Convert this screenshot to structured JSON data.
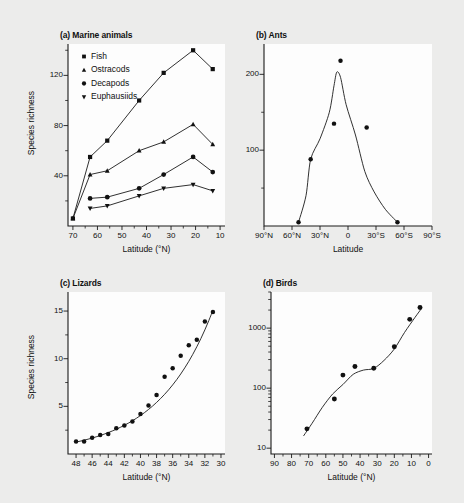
{
  "figure": {
    "background_color": "#ececeb",
    "plot_background_color": "#fdfdfd",
    "ink_color": "#1a1a1a"
  },
  "panels": {
    "a": {
      "title": "(a) Marine animals",
      "xlabel": "Latitude (°N)",
      "ylabel": "Species richness",
      "legend": [
        {
          "label": "Fish",
          "marker": "square"
        },
        {
          "label": "Ostracods",
          "marker": "triangle-up"
        },
        {
          "label": "Decapods",
          "marker": "circle"
        },
        {
          "label": "Euphausiids",
          "marker": "triangle-down"
        }
      ],
      "xticks": [
        "70",
        "60",
        "50",
        "40",
        "30",
        "20",
        "10"
      ],
      "yticks": [
        "40",
        "80",
        "120"
      ]
    },
    "b": {
      "title": "(b) Ants",
      "xlabel": "Latitude",
      "xticks": [
        "90°N",
        "60°N",
        "30°N",
        "0",
        "30°S",
        "60°S",
        "90°S"
      ],
      "yticks": [
        "100",
        "200"
      ]
    },
    "c": {
      "title": "(c) Lizards",
      "xlabel": "Latitude (°N)",
      "ylabel": "Species richness",
      "xticks": [
        "48",
        "46",
        "44",
        "42",
        "40",
        "38",
        "36",
        "34",
        "32",
        "30"
      ],
      "yticks": [
        "5",
        "10",
        "15"
      ]
    },
    "d": {
      "title": "(d) Birds",
      "xlabel": "Latitude (°N)",
      "xticks": [
        "90",
        "80",
        "70",
        "60",
        "50",
        "40",
        "30",
        "20",
        "10",
        "0"
      ],
      "yticks": [
        "10",
        "100",
        "1000"
      ]
    }
  },
  "chart_data": [
    {
      "panel": "a",
      "type": "line",
      "title": "(a) Marine animals",
      "xlabel": "Latitude (°N)",
      "ylabel": "Species richness",
      "xlim": [
        72,
        8
      ],
      "ylim": [
        0,
        145
      ],
      "x_reversed": true,
      "grid": false,
      "legend_position": "upper-left",
      "x": [
        70,
        63,
        56,
        43,
        33,
        21,
        13
      ],
      "series": [
        {
          "name": "Fish",
          "marker": "square",
          "values": [
            6,
            55,
            68,
            100,
            122,
            140,
            125
          ]
        },
        {
          "name": "Ostracods",
          "marker": "triangle-up",
          "values": [
            6,
            41,
            44,
            60,
            67,
            81,
            65
          ]
        },
        {
          "name": "Decapods",
          "marker": "circle",
          "values": [
            null,
            22,
            23,
            30,
            41,
            55,
            43
          ]
        },
        {
          "name": "Euphausiids",
          "marker": "triangle-down",
          "values": [
            null,
            14,
            16,
            24,
            30,
            33,
            28
          ]
        }
      ]
    },
    {
      "panel": "b",
      "type": "scatter",
      "title": "(b) Ants",
      "xlabel": "Latitude",
      "ylabel": "",
      "xlim": [
        90,
        -90
      ],
      "ylim": [
        0,
        240
      ],
      "grid": false,
      "fit_curve": true,
      "points": [
        {
          "x": 53,
          "y": 5
        },
        {
          "x": 40,
          "y": 88
        },
        {
          "x": 15,
          "y": 135
        },
        {
          "x": 8,
          "y": 218
        },
        {
          "x": -20,
          "y": 130
        },
        {
          "x": -53,
          "y": 5
        }
      ]
    },
    {
      "panel": "c",
      "type": "scatter",
      "title": "(c) Lizards",
      "xlabel": "Latitude (°N)",
      "ylabel": "Species richness",
      "xlim": [
        49,
        29.5
      ],
      "ylim": [
        0,
        17
      ],
      "x_reversed": true,
      "grid": false,
      "fit_curve": true,
      "points": [
        {
          "x": 48.0,
          "y": 1.3
        },
        {
          "x": 47.0,
          "y": 1.3
        },
        {
          "x": 46.0,
          "y": 1.7
        },
        {
          "x": 45.0,
          "y": 2.0
        },
        {
          "x": 44.0,
          "y": 2.1
        },
        {
          "x": 43.0,
          "y": 2.7
        },
        {
          "x": 42.0,
          "y": 3.0
        },
        {
          "x": 41.0,
          "y": 3.4
        },
        {
          "x": 40.0,
          "y": 4.2
        },
        {
          "x": 39.0,
          "y": 5.1
        },
        {
          "x": 38.0,
          "y": 6.2
        },
        {
          "x": 37.0,
          "y": 8.1
        },
        {
          "x": 36.0,
          "y": 9.0
        },
        {
          "x": 35.0,
          "y": 10.3
        },
        {
          "x": 34.0,
          "y": 11.4
        },
        {
          "x": 33.0,
          "y": 12.0
        },
        {
          "x": 32.0,
          "y": 13.9
        },
        {
          "x": 31.0,
          "y": 14.9
        }
      ]
    },
    {
      "panel": "d",
      "type": "scatter",
      "title": "(d) Birds",
      "xlabel": "Latitude (°N)",
      "ylabel": "",
      "xlim": [
        92,
        -2
      ],
      "ylim": [
        8,
        4000
      ],
      "yscale": "log",
      "x_reversed": true,
      "grid": false,
      "fit_curve": true,
      "points": [
        {
          "x": 71,
          "y": 21
        },
        {
          "x": 55,
          "y": 66
        },
        {
          "x": 50,
          "y": 165
        },
        {
          "x": 43,
          "y": 230
        },
        {
          "x": 32,
          "y": 215
        },
        {
          "x": 20,
          "y": 490
        },
        {
          "x": 11,
          "y": 1400
        },
        {
          "x": 5,
          "y": 2200
        }
      ]
    }
  ]
}
